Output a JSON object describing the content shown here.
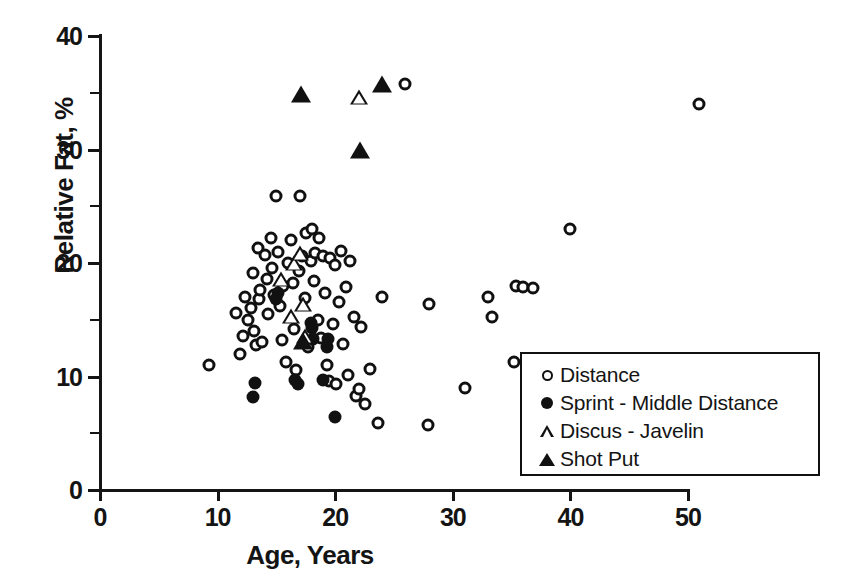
{
  "chart_data": {
    "type": "scatter",
    "title": "",
    "xlabel": "Age, Years",
    "ylabel": "Relative Fat, %",
    "xlim": [
      0,
      50
    ],
    "ylim": [
      0,
      40
    ],
    "xticks": [
      0,
      10,
      20,
      30,
      40,
      50
    ],
    "yticks": [
      0,
      10,
      20,
      30,
      40
    ],
    "x_minor_ticks": [],
    "y_minor_ticks": [
      5,
      15,
      25,
      35
    ],
    "grid": false,
    "legend_position": "bottom-right",
    "series": [
      {
        "name": "Distance",
        "marker": "circle-open",
        "points": [
          [
            9.3,
            11.0
          ],
          [
            11.6,
            15.6
          ],
          [
            11.9,
            12.0
          ],
          [
            12.2,
            13.6
          ],
          [
            12.3,
            17.0
          ],
          [
            12.6,
            15.0
          ],
          [
            12.8,
            16.0
          ],
          [
            13.0,
            19.1
          ],
          [
            13.1,
            14.0
          ],
          [
            13.3,
            12.8
          ],
          [
            13.4,
            21.3
          ],
          [
            13.5,
            16.8
          ],
          [
            13.6,
            17.6
          ],
          [
            13.8,
            13.0
          ],
          [
            14.0,
            20.7
          ],
          [
            14.2,
            18.6
          ],
          [
            14.3,
            15.5
          ],
          [
            14.5,
            22.2
          ],
          [
            14.6,
            19.6
          ],
          [
            14.8,
            17.2
          ],
          [
            15.0,
            25.9
          ],
          [
            15.1,
            21.0
          ],
          [
            15.3,
            16.2
          ],
          [
            15.5,
            13.2
          ],
          [
            15.6,
            18.0
          ],
          [
            15.8,
            11.3
          ],
          [
            16.0,
            20.0
          ],
          [
            16.2,
            22.0
          ],
          [
            16.4,
            18.2
          ],
          [
            16.5,
            14.2
          ],
          [
            16.7,
            10.6
          ],
          [
            16.9,
            19.3
          ],
          [
            17.0,
            25.9
          ],
          [
            17.2,
            20.6
          ],
          [
            17.4,
            16.9
          ],
          [
            17.5,
            22.6
          ],
          [
            17.7,
            12.6
          ],
          [
            17.9,
            20.2
          ],
          [
            18.0,
            23.0
          ],
          [
            18.2,
            18.4
          ],
          [
            18.3,
            20.9
          ],
          [
            18.5,
            15.0
          ],
          [
            18.6,
            22.2
          ],
          [
            18.8,
            13.4
          ],
          [
            19.0,
            20.6
          ],
          [
            19.1,
            17.4
          ],
          [
            19.3,
            11.0
          ],
          [
            19.5,
            9.6
          ],
          [
            19.6,
            20.4
          ],
          [
            19.8,
            14.6
          ],
          [
            20.0,
            19.8
          ],
          [
            20.1,
            9.3
          ],
          [
            20.3,
            16.6
          ],
          [
            20.5,
            21.1
          ],
          [
            20.7,
            12.9
          ],
          [
            20.9,
            17.9
          ],
          [
            21.1,
            10.1
          ],
          [
            21.3,
            20.2
          ],
          [
            21.6,
            15.2
          ],
          [
            21.8,
            8.3
          ],
          [
            22.0,
            8.9
          ],
          [
            22.2,
            14.4
          ],
          [
            22.5,
            7.6
          ],
          [
            23.0,
            10.7
          ],
          [
            23.6,
            5.9
          ],
          [
            24.0,
            17.0
          ],
          [
            25.9,
            35.8
          ],
          [
            27.9,
            5.7
          ],
          [
            28.0,
            16.4
          ],
          [
            31.0,
            9.0
          ],
          [
            33.0,
            17.0
          ],
          [
            33.3,
            15.2
          ],
          [
            35.2,
            11.3
          ],
          [
            35.4,
            18.0
          ],
          [
            36.0,
            17.9
          ],
          [
            36.8,
            17.8
          ],
          [
            40.0,
            23.0
          ],
          [
            50.9,
            34.0
          ]
        ]
      },
      {
        "name": "Sprint - Middle Distance",
        "marker": "circle-filled",
        "points": [
          [
            13.0,
            8.2
          ],
          [
            13.2,
            9.4
          ],
          [
            15.0,
            16.8
          ],
          [
            15.1,
            17.4
          ],
          [
            16.6,
            9.7
          ],
          [
            16.8,
            9.3
          ],
          [
            17.9,
            14.7
          ],
          [
            18.0,
            14.3
          ],
          [
            18.1,
            13.3
          ],
          [
            19.0,
            9.7
          ],
          [
            19.3,
            12.6
          ],
          [
            19.4,
            13.3
          ],
          [
            20.0,
            6.4
          ]
        ]
      },
      {
        "name": "Discus - Javelin",
        "marker": "triangle-open",
        "points": [
          [
            15.4,
            18.6
          ],
          [
            16.2,
            15.3
          ],
          [
            16.5,
            20.0
          ],
          [
            17.0,
            20.9
          ],
          [
            17.3,
            16.4
          ],
          [
            17.4,
            13.6
          ],
          [
            22.0,
            34.6
          ]
        ]
      },
      {
        "name": "Shot Put",
        "marker": "triangle-filled",
        "points": [
          [
            17.1,
            34.9
          ],
          [
            17.3,
            13.1
          ],
          [
            22.1,
            30.0
          ],
          [
            24.0,
            35.8
          ]
        ]
      }
    ]
  },
  "axes": {
    "y_tick_labels": [
      "40",
      "30",
      "20",
      "10",
      "0"
    ],
    "x_tick_labels": [
      "0",
      "10",
      "20",
      "30",
      "40",
      "50"
    ],
    "y_title": "Relative Fat, %",
    "x_title": "Age, Years"
  },
  "legend": {
    "entries": [
      {
        "label": "Distance",
        "symbol": "circle-open-icon"
      },
      {
        "label": "Sprint - Middle Distance",
        "symbol": "circle-filled-icon"
      },
      {
        "label": "Discus - Javelin",
        "symbol": "triangle-open-icon"
      },
      {
        "label": "Shot Put",
        "symbol": "triangle-filled-icon"
      }
    ]
  }
}
